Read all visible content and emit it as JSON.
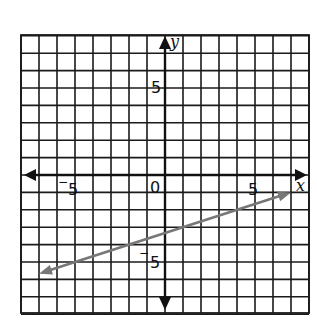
{
  "chart_data": {
    "type": "line",
    "title": "",
    "xlabel": "x",
    "ylabel": "y",
    "xlim": [
      -8,
      8
    ],
    "ylim": [
      -8,
      8
    ],
    "grid": true,
    "grid_step": 1,
    "tick_labels": {
      "x": [
        {
          "value": -5,
          "label": "5",
          "negative": true
        },
        {
          "value": 5,
          "label": "5",
          "negative": false
        }
      ],
      "y": [
        {
          "value": 5,
          "label": "5",
          "negative": false
        },
        {
          "value": -5,
          "label": "5",
          "negative": true
        }
      ],
      "origin": "0"
    },
    "series": [
      {
        "name": "line",
        "equation": "y = (1/3)x - 10/3",
        "slope": 0.3333,
        "intercept": -3.3333,
        "color": "#777777",
        "arrows": "both",
        "x": [
          -7,
          -2,
          4,
          7
        ],
        "y": [
          -5.67,
          -4,
          -2,
          -1
        ]
      }
    ],
    "legend": null
  },
  "labels": {
    "x_axis": "x",
    "y_axis": "y",
    "origin": "0",
    "x_neg5": "5",
    "x_pos5": "5",
    "y_pos5": "5",
    "y_neg5": "5",
    "minus_sign": "−"
  },
  "colors": {
    "grid": "#1a1a1a",
    "axis": "#111111",
    "line": "#777777",
    "background": "#ffffff"
  }
}
